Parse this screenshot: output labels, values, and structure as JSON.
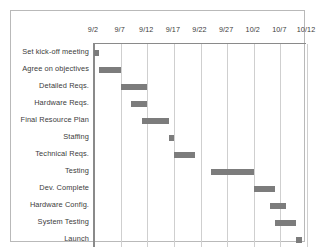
{
  "chart_data": {
    "type": "bar",
    "subtype": "gantt",
    "title": "",
    "xlabel": "",
    "ylabel": "",
    "grid": true,
    "legend": "none",
    "axis_ticks": [
      "9/2",
      "9/7",
      "9/12",
      "9/17",
      "9/22",
      "9/27",
      "10/2",
      "10/7",
      "10/12"
    ],
    "axis_tick_days": [
      0,
      5,
      10,
      15,
      20,
      25,
      30,
      35,
      40
    ],
    "xlim_labels": [
      "9/2",
      "10/12"
    ],
    "xlim_days": [
      0,
      40
    ],
    "categories": [
      "Set kick-off meeting",
      "Agree on objectives",
      "Detailed Reqs.",
      "Hardware Reqs.",
      "Final Resource Plan",
      "Staffing",
      "Technical Reqs.",
      "Testing",
      "Dev. Complete",
      "Hardware Config.",
      "System Testing",
      "Launch"
    ],
    "tasks": [
      {
        "name": "Set kick-off meeting",
        "start_day": 0,
        "end_day": 1,
        "start_label": "9/2",
        "end_label": "9/3"
      },
      {
        "name": "Agree on objectives",
        "start_day": 1,
        "end_day": 5,
        "start_label": "9/3",
        "end_label": "9/7"
      },
      {
        "name": "Detailed Reqs.",
        "start_day": 5,
        "end_day": 10,
        "start_label": "9/7",
        "end_label": "9/12"
      },
      {
        "name": "Hardware Reqs.",
        "start_day": 7,
        "end_day": 10,
        "start_label": "9/9",
        "end_label": "9/12"
      },
      {
        "name": "Final Resource Plan",
        "start_day": 9,
        "end_day": 14,
        "start_label": "9/11",
        "end_label": "9/16"
      },
      {
        "name": "Staffing",
        "start_day": 14,
        "end_day": 15,
        "start_label": "9/16",
        "end_label": "9/17"
      },
      {
        "name": "Technical Reqs.",
        "start_day": 15,
        "end_day": 19,
        "start_label": "9/17",
        "end_label": "9/21"
      },
      {
        "name": "Testing",
        "start_day": 22,
        "end_day": 30,
        "start_label": "9/24",
        "end_label": "10/2"
      },
      {
        "name": "Dev. Complete",
        "start_day": 30,
        "end_day": 34,
        "start_label": "10/2",
        "end_label": "10/6"
      },
      {
        "name": "Hardware Config.",
        "start_day": 33,
        "end_day": 36,
        "start_label": "10/5",
        "end_label": "10/8"
      },
      {
        "name": "System Testing",
        "start_day": 34,
        "end_day": 38,
        "start_label": "10/6",
        "end_label": "10/10"
      },
      {
        "name": "Launch",
        "start_day": 38,
        "end_day": 39,
        "start_label": "10/10",
        "end_label": "10/11"
      }
    ],
    "colors": {
      "bar": "#7c7c7c",
      "gridline": "#cfcfcf",
      "axis": "#8a8a8a",
      "frame": "#b9b9b9",
      "text": "#3b3b3b",
      "background": "#ffffff"
    }
  }
}
